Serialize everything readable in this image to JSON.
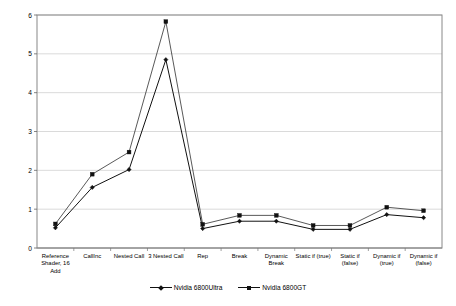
{
  "chart_data": {
    "type": "line",
    "title": "",
    "xlabel": "",
    "ylabel": "Time (in sec) for 1500 Quads (512x512)",
    "ylim": [
      0,
      6
    ],
    "yticks": [
      0,
      1,
      2,
      3,
      4,
      5,
      6
    ],
    "grid": true,
    "legend_position": "bottom",
    "categories": [
      "Reference Shader, 16 Add",
      "CallInc",
      "Nested Call",
      "3 Nested Call",
      "Rep",
      "Break",
      "Dynamic Break",
      "Static if (true)",
      "Static if (false)",
      "Dynamic if (true)",
      "Dynamic if (false)"
    ],
    "series": [
      {
        "name": "Nvidia 6800Ultra",
        "color": "#111111",
        "marker": "diamond",
        "values": [
          0.52,
          1.56,
          2.02,
          4.85,
          0.5,
          0.69,
          0.69,
          0.48,
          0.48,
          0.86,
          0.78
        ]
      },
      {
        "name": "Nvidia 6800GT",
        "color": "#111111",
        "marker": "square",
        "values": [
          0.62,
          1.9,
          2.47,
          5.83,
          0.61,
          0.84,
          0.84,
          0.58,
          0.58,
          1.05,
          0.96
        ]
      }
    ]
  },
  "axes": {
    "y_title": "Time (in sec) for 1500 Quads (512x512)",
    "y_tick_labels": [
      "6",
      "5",
      "4",
      "3",
      "2",
      "1",
      "0"
    ]
  },
  "legend": {
    "items": [
      {
        "label": "Nvidia 6800Ultra"
      },
      {
        "label": "Nvidia 6800GT"
      }
    ]
  }
}
